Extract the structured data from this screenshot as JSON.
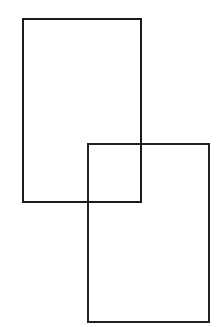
{
  "page": {
    "background_color": "#ffffff",
    "width": 217,
    "height": 327
  },
  "figure": {
    "name": "two-overlapping-rectangles",
    "stroke_color": "#1a1a1a",
    "stroke_width": 2,
    "fill": "none",
    "shape_count": 2,
    "shapes": [
      {
        "id": "rect-upper-left",
        "label": "Upper left rectangle",
        "x": 22,
        "y": 18,
        "width": 120,
        "height": 185,
        "stroke_color": "#1a1a1a",
        "stroke_width": 2,
        "fill": "none"
      },
      {
        "id": "rect-lower-right",
        "label": "Lower right rectangle",
        "x": 87,
        "y": 143,
        "width": 123,
        "height": 180,
        "stroke_color": "#222222",
        "stroke_width": 2,
        "fill": "none"
      }
    ],
    "overlap": {
      "label": "Intersection region",
      "x": 87,
      "y": 143,
      "width": 55,
      "height": 60
    }
  }
}
